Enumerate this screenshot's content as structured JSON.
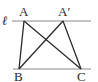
{
  "diagram": {
    "type": "geometry",
    "line_label": "ℓ",
    "points": {
      "A": "A",
      "A_prime": "A′",
      "B": "B",
      "C": "C"
    },
    "segments": [
      "AB",
      "AC",
      "A′B",
      "A′C"
    ],
    "parallel_lines": [
      "ℓ",
      "BC"
    ],
    "colors": {
      "parallel_line": "#8a8a8a",
      "segment": "#2a2a2a",
      "text": "#2a2a2a"
    }
  }
}
